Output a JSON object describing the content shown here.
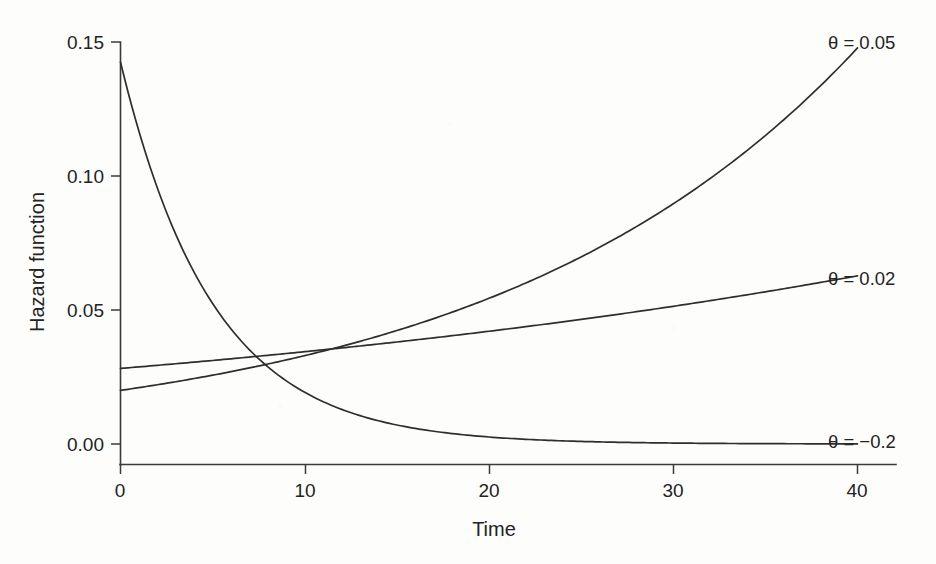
{
  "chart_data": {
    "type": "line",
    "title": "",
    "subtitle": "",
    "xlabel": "Time",
    "ylabel": "Hazard function",
    "xlim": [
      0,
      42
    ],
    "ylim": [
      0.0,
      0.15
    ],
    "xticks": [
      0,
      10,
      20,
      30,
      40
    ],
    "xticklabels": [
      "0",
      "10",
      "20",
      "30",
      "40"
    ],
    "yticks": [
      0.0,
      0.05,
      0.1,
      0.15
    ],
    "yticklabels": [
      "0.00",
      "0.05",
      "0.10",
      "0.15"
    ],
    "grid": false,
    "legend": "inline-right-of-curve-ends",
    "x": [
      0,
      2,
      4,
      6,
      8,
      10,
      12,
      14,
      16,
      18,
      20,
      22,
      24,
      26,
      28,
      30,
      32,
      34,
      36,
      38,
      40
    ],
    "series": [
      {
        "name": "theta = 0.05",
        "label": "θ = 0.05",
        "theta": 0.05,
        "h0": 0.02,
        "formula": "h(t) = 0.02 * exp(0.05 t)",
        "values": [
          0.02,
          0.0221,
          0.0244,
          0.027,
          0.0298,
          0.033,
          0.0364,
          0.0403,
          0.0445,
          0.0492,
          0.0544,
          0.0601,
          0.0664,
          0.0734,
          0.0811,
          0.0896,
          0.099,
          0.1094,
          0.1209,
          0.1336,
          0.1477
        ]
      },
      {
        "name": "theta = 0.02",
        "label": "θ = 0.02",
        "theta": 0.02,
        "h0": 0.0282,
        "formula": "h(t) = 0.0282 * exp(0.02 t)",
        "values": [
          0.0282,
          0.0294,
          0.0305,
          0.0318,
          0.0331,
          0.0344,
          0.0358,
          0.0373,
          0.0388,
          0.0404,
          0.0421,
          0.0438,
          0.0456,
          0.0474,
          0.0494,
          0.0514,
          0.0535,
          0.0556,
          0.0579,
          0.0603,
          0.0627
        ]
      },
      {
        "name": "theta = -0.2",
        "label": "θ = −0.2",
        "theta": -0.2,
        "h0": 0.1425,
        "formula": "h(t) = 0.1425 * exp(-0.2 t)",
        "values": [
          0.1425,
          0.09551,
          0.06403,
          0.04292,
          0.02877,
          0.01929,
          0.01293,
          0.00866,
          0.00581,
          0.00389,
          0.00261,
          0.00175,
          0.00117,
          0.00079,
          0.00053,
          0.00035,
          0.00024,
          0.00016,
          0.00011,
          7e-05,
          5e-05
        ]
      }
    ]
  },
  "axes": {
    "y_title": "Hazard function",
    "x_title": "Time"
  },
  "labels": {
    "curve_top": "θ = 0.05",
    "curve_mid": "θ = 0.02",
    "curve_bottom": "θ = −0.2"
  },
  "ticks": {
    "y": [
      "0.00",
      "0.05",
      "0.10",
      "0.15"
    ],
    "x": [
      "0",
      "10",
      "20",
      "30",
      "40"
    ]
  },
  "colors": {
    "background": "#fdfdfc",
    "line": "#2e2e2e",
    "axis": "#3a3a3a",
    "text": "#232323"
  }
}
